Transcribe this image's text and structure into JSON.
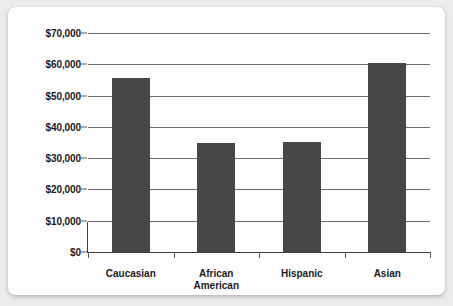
{
  "chart_data": {
    "type": "bar",
    "title": "",
    "subtitle": "",
    "xlabel": "",
    "ylabel": "",
    "categories": [
      "Caucasian",
      "African\nAmerican",
      "Hispanic",
      "Asian"
    ],
    "values": [
      55500,
      34800,
      35200,
      60500
    ],
    "ylim": [
      0,
      70000
    ],
    "ytick_values": [
      70000,
      60000,
      50000,
      40000,
      30000,
      20000,
      10000,
      0
    ],
    "ytick_labels": [
      "$70,000",
      "$60,000",
      "$50,000",
      "$40,000",
      "$30,000",
      "$20,000",
      "$10,000",
      "$0"
    ],
    "grid": true,
    "legend": false,
    "bar_color": "#474747",
    "gridline_color": "#6f6f6f",
    "axis_color": "#3d3d3d",
    "background_color": "#fdfdfd",
    "page_background_color": "#ececec"
  }
}
